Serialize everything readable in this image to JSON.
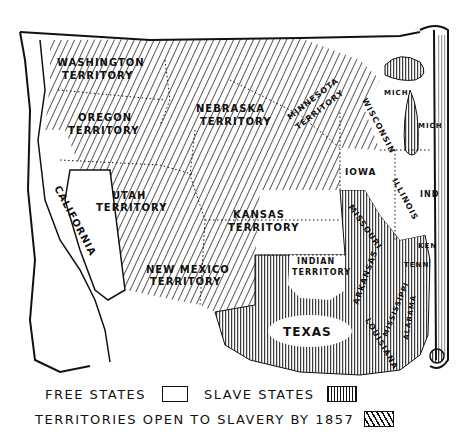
{
  "map": {
    "title": "",
    "regions": [
      {
        "label": "WASHINGTON TERRITORY",
        "line1": "WASHINGTON",
        "line2": "TERRITORY",
        "status": "territory"
      },
      {
        "label": "OREGON TERRITORY",
        "line1": "OREGON",
        "line2": "TERRITORY",
        "status": "territory"
      },
      {
        "label": "NEBRASKA TERRITORY",
        "line1": "NEBRASKA",
        "line2": "TERRITORY",
        "status": "territory"
      },
      {
        "label": "MINNESOTA TERRITORY",
        "line1": "MINNESOTA",
        "line2": "TERRITORY",
        "status": "territory"
      },
      {
        "label": "UTAH TERRITORY",
        "line1": "UTAH",
        "line2": "TERRITORY",
        "status": "territory"
      },
      {
        "label": "KANSAS TERRITORY",
        "line1": "KANSAS",
        "line2": "TERRITORY",
        "status": "territory"
      },
      {
        "label": "NEW MEXICO TERRITORY",
        "line1": "NEW MEXICO",
        "line2": "TERRITORY",
        "status": "territory"
      },
      {
        "label": "INDIAN TERRITORY",
        "line1": "INDIAN",
        "line2": "TERRITORY",
        "status": "free"
      },
      {
        "label": "CALIFORNIA",
        "line1": "CALIFORNIA",
        "status": "free"
      },
      {
        "label": "IOWA",
        "line1": "IOWA",
        "status": "free"
      },
      {
        "label": "WISCONSIN",
        "line1": "WISCONSIN",
        "status": "free"
      },
      {
        "label": "MICH",
        "line1": "MICH",
        "status": "free"
      },
      {
        "label": "MICH",
        "line1": "MICH",
        "status": "free"
      },
      {
        "label": "ILLINOIS",
        "line1": "ILLINOIS",
        "status": "free"
      },
      {
        "label": "IND",
        "line1": "IND",
        "status": "free"
      },
      {
        "label": "TEXAS",
        "line1": "TEXAS",
        "status": "slave"
      },
      {
        "label": "MISSOURI",
        "line1": "MISSOURI",
        "status": "slave"
      },
      {
        "label": "ARKANSAS",
        "line1": "ARKANSAS",
        "status": "slave"
      },
      {
        "label": "LOUISIANA",
        "line1": "LOUISIANA",
        "status": "slave"
      },
      {
        "label": "MISSISSIPPI",
        "line1": "MISSISSIPPI",
        "status": "slave"
      },
      {
        "label": "ALABAMA",
        "line1": "ALABAMA",
        "status": "slave"
      },
      {
        "label": "TENN",
        "line1": "TENN",
        "status": "slave"
      },
      {
        "label": "KEN",
        "line1": "KEN",
        "status": "slave"
      }
    ]
  },
  "legend": {
    "free_label": "FREE STATES",
    "slave_label": "SLAVE STATES",
    "territories_label": "TERRITORIES OPEN TO SLAVERY BY 1857"
  },
  "colors": {
    "ink": "#111111",
    "paper": "#ffffff"
  }
}
